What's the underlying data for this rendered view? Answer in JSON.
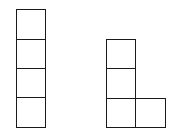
{
  "diagram": {
    "line_color": "#1a1a1a",
    "background": "#ffffff",
    "unit_px": 29.5,
    "shapes": [
      {
        "name": "i-tetromino",
        "cells": [
          {
            "x": 16,
            "y": 9,
            "w": 30,
            "h": 30.5
          },
          {
            "x": 16,
            "y": 38.5,
            "w": 30,
            "h": 30
          },
          {
            "x": 16,
            "y": 68,
            "w": 30,
            "h": 30
          },
          {
            "x": 16,
            "y": 97,
            "w": 30,
            "h": 30.5
          }
        ]
      },
      {
        "name": "l-tetromino",
        "cells": [
          {
            "x": 105.5,
            "y": 39,
            "w": 30.5,
            "h": 30
          },
          {
            "x": 105.5,
            "y": 68,
            "w": 30.5,
            "h": 30.5
          },
          {
            "x": 105.5,
            "y": 97.5,
            "w": 30.5,
            "h": 30
          },
          {
            "x": 135,
            "y": 97.5,
            "w": 31,
            "h": 30
          }
        ]
      }
    ]
  }
}
